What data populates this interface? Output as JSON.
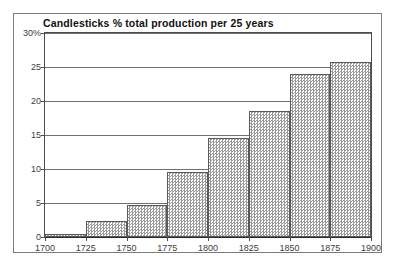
{
  "chart_data": {
    "type": "bar",
    "title": "Candlesticks % total production per 25 years",
    "xlabel": "",
    "ylabel": "",
    "categories": [
      "1700",
      "1725",
      "1750",
      "1775",
      "1800",
      "1825",
      "1850",
      "1875"
    ],
    "bin_edges": [
      "1700",
      "1725",
      "1750",
      "1775",
      "1800",
      "1825",
      "1850",
      "1875",
      "1900"
    ],
    "values": [
      0.4,
      2.3,
      4.7,
      9.5,
      14.5,
      18.6,
      23.9,
      25.8
    ],
    "ylim": [
      0,
      30
    ],
    "xlim": [
      "1700",
      "1900"
    ],
    "ytick_labels": [
      "30%",
      "25",
      "20",
      "15",
      "10",
      "5",
      "0"
    ],
    "ytick_values": [
      30,
      25,
      20,
      15,
      10,
      5,
      0
    ],
    "xtick_labels": [
      "1700",
      "1725",
      "1750",
      "1775",
      "1800",
      "1825",
      "1850",
      "1875",
      "1900"
    ],
    "grid": "horizontal",
    "legend": null,
    "bar_fill": "#9a9a9a",
    "bar_edge": "#5a5a5a",
    "frame_color": "#7a7a7a",
    "background": "#ffffff"
  }
}
